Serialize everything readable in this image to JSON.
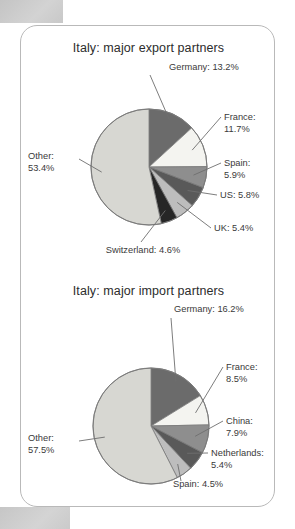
{
  "page": {
    "background_color": "#ffffff",
    "card_border_color": "#b9b9b9",
    "scan_block_color": "#c9c9c9"
  },
  "palette": {
    "slice_dark_gray": "#6b6b6b",
    "slice_white": "#f4f4f0",
    "slice_mid_gray": "#8e8e8e",
    "slice_charcoal": "#595959",
    "slice_light_mid": "#bdbdbd",
    "slice_black": "#262626",
    "slice_other_light": "#d7d7d2",
    "outline": "#7a7a7a",
    "leader_line": "#6e6e6e",
    "label_text": "#3a3a3a",
    "title_text": "#2c2c2c"
  },
  "charts": [
    {
      "id": "export",
      "title": "Italy: major export partners",
      "labels": [
        {
          "name": "germany",
          "text": "Germany: 13.2%"
        },
        {
          "name": "france",
          "text": "France:\n11.7%"
        },
        {
          "name": "spain",
          "text": "Spain:\n5.9%"
        },
        {
          "name": "us",
          "text": "US: 5.8%"
        },
        {
          "name": "uk",
          "text": "UK: 5.4%"
        },
        {
          "name": "switzerland",
          "text": "Switzerland: 4.6%"
        },
        {
          "name": "other",
          "text": "Other:\n53.4%"
        }
      ]
    },
    {
      "id": "import",
      "title": "Italy: major import partners",
      "labels": [
        {
          "name": "germany",
          "text": "Germany: 16.2%"
        },
        {
          "name": "france",
          "text": "France:\n8.5%"
        },
        {
          "name": "china",
          "text": "China:\n7.9%"
        },
        {
          "name": "netherlands",
          "text": "Netherlands:\n5.4%"
        },
        {
          "name": "spain",
          "text": "Spain: 4.5%"
        },
        {
          "name": "other",
          "text": "Other:\n57.5%"
        }
      ]
    }
  ],
  "chart_data": [
    {
      "type": "pie",
      "title": "Italy: major export partners",
      "xlabel": "",
      "ylabel": "",
      "legend": "none (direct labels with leader lines)",
      "units": "percent",
      "start_angle_deg": 0,
      "direction": "clockwise",
      "categories": [
        "Germany",
        "France",
        "Spain",
        "US",
        "UK",
        "Switzerland",
        "Other"
      ],
      "values": [
        13.2,
        11.7,
        5.9,
        5.8,
        5.4,
        4.6,
        53.4
      ],
      "slice_colors": [
        "#6b6b6b",
        "#f4f4f0",
        "#8e8e8e",
        "#595959",
        "#bdbdbd",
        "#262626",
        "#d7d7d2"
      ],
      "data_labels": [
        "Germany: 13.2%",
        "France: 11.7%",
        "Spain: 5.9%",
        "US: 5.8%",
        "UK: 5.4%",
        "Switzerland: 4.6%",
        "Other: 53.4%"
      ]
    },
    {
      "type": "pie",
      "title": "Italy: major import partners",
      "xlabel": "",
      "ylabel": "",
      "legend": "none (direct labels with leader lines)",
      "units": "percent",
      "start_angle_deg": 0,
      "direction": "clockwise",
      "categories": [
        "Germany",
        "France",
        "China",
        "Netherlands",
        "Spain",
        "Other"
      ],
      "values": [
        16.2,
        8.5,
        7.9,
        5.4,
        4.5,
        57.5
      ],
      "slice_colors": [
        "#6b6b6b",
        "#f4f4f0",
        "#8e8e8e",
        "#595959",
        "#bdbdbd",
        "#d7d7d2"
      ],
      "data_labels": [
        "Germany: 16.2%",
        "France: 8.5%",
        "China: 7.9%",
        "Netherlands: 5.4%",
        "Spain: 4.5%",
        "Other: 57.5%"
      ]
    }
  ]
}
